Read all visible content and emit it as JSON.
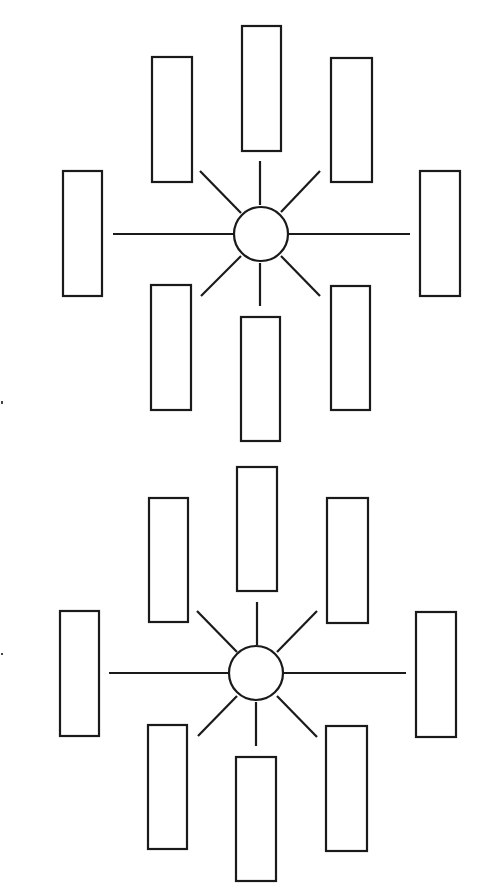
{
  "page": {
    "width": 486,
    "height": 894,
    "background": "#ffffff",
    "ink": "#1a1a1a"
  },
  "diagrams": [
    {
      "name": "top-spider-diagram",
      "hub": {
        "cx": 261,
        "cy": 234,
        "r": 27
      },
      "boxes": [
        {
          "name": "top-center",
          "x": 242,
          "y": 26,
          "w": 39,
          "h": 125
        },
        {
          "name": "upper-left",
          "x": 152,
          "y": 57,
          "w": 40,
          "h": 125
        },
        {
          "name": "upper-right",
          "x": 331,
          "y": 58,
          "w": 41,
          "h": 124
        },
        {
          "name": "left",
          "x": 63,
          "y": 171,
          "w": 39,
          "h": 125
        },
        {
          "name": "right",
          "x": 420,
          "y": 171,
          "w": 40,
          "h": 125
        },
        {
          "name": "lower-left",
          "x": 151,
          "y": 285,
          "w": 40,
          "h": 125
        },
        {
          "name": "lower-right",
          "x": 331,
          "y": 286,
          "w": 39,
          "h": 124
        },
        {
          "name": "bottom-center",
          "x": 241,
          "y": 317,
          "w": 39,
          "h": 124
        }
      ],
      "spokes": [
        {
          "name": "left",
          "x1": 113,
          "y1": 234,
          "x2": 233,
          "y2": 234
        },
        {
          "name": "right",
          "x1": 289,
          "y1": 234,
          "x2": 410,
          "y2": 234
        },
        {
          "name": "up",
          "x1": 260,
          "y1": 161,
          "x2": 260,
          "y2": 205
        },
        {
          "name": "down",
          "x1": 260,
          "y1": 263,
          "x2": 260,
          "y2": 306
        },
        {
          "name": "up-left",
          "x1": 200,
          "y1": 171,
          "x2": 241,
          "y2": 213
        },
        {
          "name": "up-right",
          "x1": 320,
          "y1": 171,
          "x2": 281,
          "y2": 212
        },
        {
          "name": "down-left",
          "x1": 201,
          "y1": 296,
          "x2": 241,
          "y2": 256
        },
        {
          "name": "down-right",
          "x1": 320,
          "y1": 296,
          "x2": 281,
          "y2": 256
        }
      ]
    },
    {
      "name": "bottom-spider-diagram",
      "hub": {
        "cx": 256,
        "cy": 673,
        "r": 27
      },
      "boxes": [
        {
          "name": "top-center",
          "x": 237,
          "y": 467,
          "w": 40,
          "h": 124
        },
        {
          "name": "upper-left",
          "x": 149,
          "y": 498,
          "w": 39,
          "h": 124
        },
        {
          "name": "upper-right",
          "x": 327,
          "y": 498,
          "w": 41,
          "h": 125
        },
        {
          "name": "left",
          "x": 60,
          "y": 611,
          "w": 39,
          "h": 125
        },
        {
          "name": "right",
          "x": 416,
          "y": 612,
          "w": 40,
          "h": 125
        },
        {
          "name": "lower-left",
          "x": 148,
          "y": 725,
          "w": 39,
          "h": 124
        },
        {
          "name": "lower-right",
          "x": 326,
          "y": 726,
          "w": 41,
          "h": 125
        },
        {
          "name": "bottom-center",
          "x": 236,
          "y": 757,
          "w": 40,
          "h": 124
        }
      ],
      "spokes": [
        {
          "name": "left",
          "x1": 109,
          "y1": 673,
          "x2": 229,
          "y2": 673
        },
        {
          "name": "right",
          "x1": 284,
          "y1": 673,
          "x2": 406,
          "y2": 673
        },
        {
          "name": "up",
          "x1": 257,
          "y1": 602,
          "x2": 257,
          "y2": 645
        },
        {
          "name": "down",
          "x1": 256,
          "y1": 702,
          "x2": 256,
          "y2": 746
        },
        {
          "name": "up-left",
          "x1": 197,
          "y1": 611,
          "x2": 237,
          "y2": 652
        },
        {
          "name": "up-right",
          "x1": 317,
          "y1": 611,
          "x2": 277,
          "y2": 652
        },
        {
          "name": "down-left",
          "x1": 198,
          "y1": 736,
          "x2": 237,
          "y2": 696
        },
        {
          "name": "down-right",
          "x1": 317,
          "y1": 737,
          "x2": 277,
          "y2": 696
        }
      ]
    }
  ],
  "scan_marks": [
    {
      "x": 1,
      "y": 401,
      "w": 2,
      "h": 3
    },
    {
      "x": 1,
      "y": 653,
      "w": 2,
      "h": 2
    }
  ]
}
